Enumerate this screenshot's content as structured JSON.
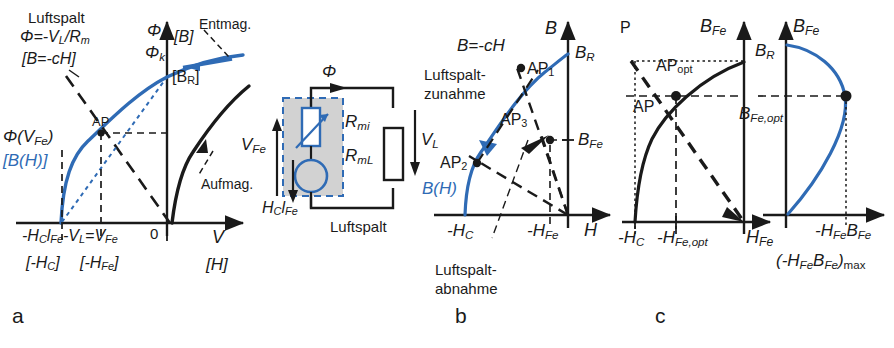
{
  "figure": {
    "type": "technical-diagram",
    "colors": {
      "blue": "#2f6bb5",
      "black": "#1a1a1a",
      "gray_fill": "#d2d2d2",
      "background": "#ffffff"
    },
    "panel_labels": {
      "a": "a",
      "b": "b",
      "c": "c"
    }
  },
  "panel_a": {
    "name": "Flussverlauf mit Luftspalt",
    "annotations": {
      "luftspalt": "Luftspalt",
      "phi_eq": "Φ=-V",
      "phi_eq_sub_L": "L",
      "phi_eq_tail": "/R",
      "phi_eq_sub_m": "m",
      "bracket_bch": "[B=-cH]",
      "entmag": "Entmag.",
      "aufmag": "Aufmag.",
      "ap": "AP",
      "phi_vfe": "Φ(V",
      "phi_vfe_sub": "Fe",
      "phi_vfe_tail": ")",
      "bracket_bh": "[B(H)]",
      "phi": "Φ",
      "phi_k": "Φ",
      "phi_k_sub": "k",
      "bracket_b": "[B]",
      "bracket_br": "[B",
      "bracket_br_sub": "R",
      "bracket_br_tail": "]",
      "zero": "0",
      "axis_x": "V",
      "axis_x_bracket": "[H]",
      "x_label_main": "-H",
      "x_label_main_sub1": "C",
      "x_label_main_mid": "l",
      "x_label_main_sub2": "Fe",
      "x_label_main_2": "-V",
      "x_label_main_sub3": "L",
      "x_label_main_3": "=V",
      "x_label_main_sub4": "Fe",
      "x_bracket_hc": "[-H",
      "x_bracket_hc_sub": "C",
      "x_bracket_hc_tail": "]",
      "x_bracket_hfe": "[-H",
      "x_bracket_hfe_sub": "Fe",
      "x_bracket_hfe_tail": "]"
    }
  },
  "panel_circuit": {
    "name": "Magnetisches Ersatzschaltbild",
    "labels": {
      "phi": "Φ",
      "v_fe": "V",
      "v_fe_sub": "Fe",
      "hc_lfe": "H",
      "hc_lfe_sub1": "C",
      "hc_lfe_mid": "l",
      "hc_lfe_sub2": "Fe",
      "r_mi": "R",
      "r_mi_sub": "mi",
      "r_ml": "R",
      "r_ml_sub": "mL",
      "v_l": "V",
      "v_l_sub": "L",
      "luftspalt": "Luftspalt"
    }
  },
  "panel_b": {
    "name": "Entmagnetisierungskennlinie mit Arbeitspunkten",
    "annotations": {
      "b_ch": "B=-cH",
      "luftspalt_zunahme_l1": "Luftspalt-",
      "luftspalt_zunahme_l2": "zunahme",
      "luftspalt_abnahme_l1": "Luftspalt-",
      "luftspalt_abnahme_l2": "abnahme",
      "bh": "B(H)",
      "ap1": "AP",
      "ap1_sub": "1",
      "ap2": "AP",
      "ap2_sub": "2",
      "ap3": "AP",
      "ap3_sub": "3",
      "axis_y": "B",
      "axis_x": "H",
      "b_r": "B",
      "b_r_sub": "R",
      "b_fe": "B",
      "b_fe_sub": "Fe",
      "minus_hc": "-H",
      "minus_hc_sub": "C",
      "minus_hfe": "-H",
      "minus_hfe_sub": "Fe"
    }
  },
  "panel_c": {
    "name": "Optimaler Arbeitspunkt und maximales Energieprodukt",
    "left": {
      "p": "P",
      "ap_opt": "AP",
      "ap_opt_sub": "opt",
      "ap": "AP",
      "axis_y": "B",
      "axis_y_sub": "Fe",
      "axis_x": "H",
      "axis_x_sub": "Fe",
      "minus_hc": "-H",
      "minus_hc_sub": "C",
      "minus_hfe_opt": "-H",
      "minus_hfe_opt_sub": "Fe,opt"
    },
    "right": {
      "axis_y": "B",
      "axis_y_sub": "Fe",
      "b_r": "B",
      "b_r_sub": "R",
      "b_fe_opt": "B",
      "b_fe_opt_sub": "Fe,opt",
      "axis_x": "-H",
      "axis_x_sub1": "Fe",
      "axis_x_b": "B",
      "axis_x_sub2": "Fe",
      "max_label_open": "(-H",
      "max_label_sub1": "Fe",
      "max_label_b": "B",
      "max_label_sub2": "Fe",
      "max_label_close": ")",
      "max_label_sub3": "max"
    }
  }
}
